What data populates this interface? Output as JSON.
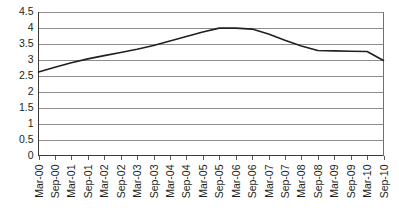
{
  "chart_data": {
    "type": "line",
    "title": "",
    "subtitle": "",
    "xlabel": "",
    "ylabel": "",
    "grid": "horizontal",
    "legend": "none",
    "ylim": [
      0,
      4.5
    ],
    "yticks": [
      "0",
      "0.5",
      "1",
      "1.5",
      "2",
      "2.5",
      "3",
      "3.5",
      "4",
      "4.5"
    ],
    "ytick_values": [
      0,
      0.5,
      1,
      1.5,
      2,
      2.5,
      3,
      3.5,
      4,
      4.5
    ],
    "categories": [
      "Mar-00",
      "Sep-00",
      "Mar-01",
      "Sep-01",
      "Mar-02",
      "Sep-02",
      "Mar-03",
      "Sep-03",
      "Mar-04",
      "Sep-04",
      "Mar-05",
      "Sep-05",
      "Mar-06",
      "Sep-06",
      "Mar-07",
      "Sep-07",
      "Mar-08",
      "Sep-08",
      "Mar-09",
      "Sep-09",
      "Mar-10",
      "Sep-10"
    ],
    "series": [
      {
        "name": "series-1",
        "color": "#231f20",
        "values": [
          2.61,
          2.76,
          2.9,
          3.02,
          3.12,
          3.22,
          3.32,
          3.44,
          3.58,
          3.72,
          3.86,
          3.98,
          3.98,
          3.95,
          3.8,
          3.6,
          3.42,
          3.28,
          3.27,
          3.26,
          3.25,
          2.97
        ]
      }
    ]
  }
}
